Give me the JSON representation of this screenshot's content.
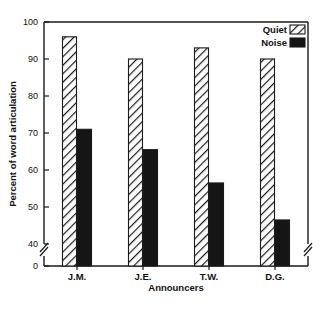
{
  "chart_data": {
    "type": "bar",
    "title": "",
    "xlabel": "Announcers",
    "ylabel": "Percent of word articulation",
    "categories": [
      "J.M.",
      "J.E.",
      "T.W.",
      "D.G."
    ],
    "series": [
      {
        "name": "Quiet",
        "values": [
          96,
          90,
          93,
          90
        ],
        "fill": "hatch",
        "color": "#ffffff"
      },
      {
        "name": "Noise",
        "values": [
          71,
          65.5,
          56.5,
          46.5
        ],
        "fill": "solid",
        "color": "#151515"
      }
    ],
    "ylim": [
      0,
      100
    ],
    "yticks": [
      0,
      40,
      50,
      60,
      70,
      80,
      90,
      100
    ],
    "ytick_labels": [
      "0",
      "40",
      "50",
      "60",
      "70",
      "80",
      "90",
      "100"
    ],
    "axis_break": true,
    "axis_break_between": [
      0,
      40
    ],
    "grid": false,
    "legend_position": "top-right",
    "legend_entries": [
      {
        "label": "Quiet",
        "swatch": "hatch"
      },
      {
        "label": "Noise",
        "swatch": "solid"
      }
    ]
  },
  "figure": {
    "background_color": "#ffffff",
    "line_color": "#1a1a1a"
  }
}
